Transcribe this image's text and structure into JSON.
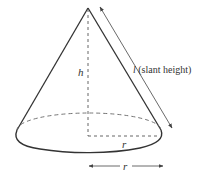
{
  "diagram": {
    "labels": {
      "height": "h",
      "slant_symbol": "l",
      "slant_text": " (slant height)",
      "radius_inner": "r",
      "radius_below": "r"
    },
    "colors": {
      "outline": "#333333",
      "dashed": "#555555",
      "arrow": "#444444",
      "background": "#ffffff"
    }
  }
}
